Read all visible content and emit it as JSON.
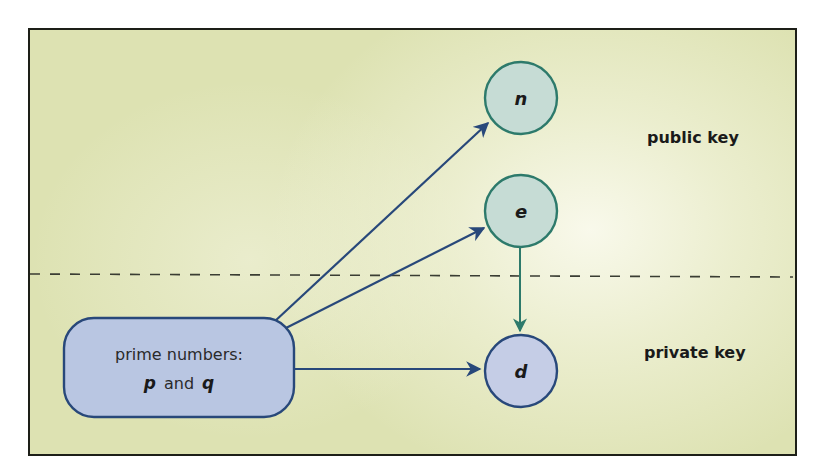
{
  "diagram": {
    "type": "key-generation-flow",
    "colors": {
      "background": "#dde2b2",
      "frame_border": "#1d1f18",
      "divider": "#3a3d33",
      "public_node_fill": "#c6dcd5",
      "public_node_stroke": "#2d7a6b",
      "private_node_fill": "#c5cde6",
      "private_node_stroke": "#28487a",
      "source_box_fill": "#b9c6e2",
      "source_box_stroke": "#28487a",
      "arrow_navy": "#28487a",
      "arrow_teal": "#2d7a6b"
    },
    "source_box": {
      "line1": "prime numbers:",
      "p": "p",
      "and": "and",
      "q": "q"
    },
    "nodes": {
      "n": {
        "label": "n",
        "group": "public"
      },
      "e": {
        "label": "e",
        "group": "public"
      },
      "d": {
        "label": "d",
        "group": "private"
      }
    },
    "regions": {
      "public": {
        "label": "public key"
      },
      "private": {
        "label": "private key"
      }
    },
    "edges": [
      {
        "from": "source_box",
        "to": "n"
      },
      {
        "from": "source_box",
        "to": "e"
      },
      {
        "from": "source_box",
        "to": "d"
      },
      {
        "from": "e",
        "to": "d"
      }
    ]
  }
}
